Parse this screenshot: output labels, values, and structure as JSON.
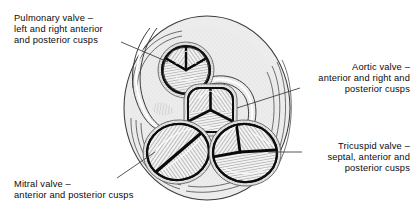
{
  "figure": {
    "type": "anatomical-line-drawing",
    "style": "pen-and-ink engraving with hatching",
    "colors": {
      "background": "#ffffff",
      "ink": "#111111",
      "tissue_fill": "#e9e9e9",
      "cusp_fill": "#f4f4f4",
      "shadow": "#c9c9c9",
      "leader_line": "#444444"
    }
  },
  "labels": {
    "pulmonary": {
      "name": "Pulmonary valve",
      "lines": [
        "Pulmonary valve –",
        "left and right anterior",
        "and posterior cusps"
      ]
    },
    "aortic": {
      "name": "Aortic valve",
      "lines": [
        "Aortic valve –",
        "anterior and right and",
        "posterior cusps"
      ]
    },
    "tricuspid": {
      "name": "Tricuspid valve",
      "lines": [
        "Tricuspid valve –",
        "septal, anterior and",
        "posterior cusps"
      ]
    },
    "mitral": {
      "name": "Mitral valve",
      "lines": [
        "Mitral valve –",
        "anterior and posterior cusps"
      ]
    }
  },
  "valves": [
    {
      "id": "pulmonary",
      "label": "Pulmonary valve",
      "cusp_count": 3,
      "cusps": [
        "left anterior",
        "right anterior",
        "posterior"
      ],
      "shape": "circular",
      "position": "upper-left-of-centre",
      "cx": 186,
      "cy": 70,
      "rx": 26,
      "ry": 25
    },
    {
      "id": "aortic",
      "label": "Aortic valve",
      "cusp_count": 3,
      "cusps": [
        "anterior",
        "right",
        "posterior"
      ],
      "shape": "rounded-square",
      "position": "centre",
      "cx": 210,
      "cy": 110,
      "rx": 25,
      "ry": 24
    },
    {
      "id": "mitral",
      "label": "Mitral valve",
      "cusp_count": 2,
      "cusps": [
        "anterior",
        "posterior"
      ],
      "shape": "oval-with-oblique-commissure",
      "position": "lower-left",
      "cx": 178,
      "cy": 152,
      "rx": 32,
      "ry": 29
    },
    {
      "id": "tricuspid",
      "label": "Tricuspid valve",
      "cusp_count": 3,
      "cusps": [
        "septal",
        "anterior",
        "posterior"
      ],
      "shape": "oval",
      "position": "lower-right",
      "cx": 245,
      "cy": 153,
      "rx": 33,
      "ry": 30
    }
  ],
  "leaders": [
    {
      "from": "pulmonary-label",
      "to": "pulmonary-valve"
    },
    {
      "from": "aortic-label",
      "to": "aortic-valve"
    },
    {
      "from": "tricuspid-label",
      "to": "tricuspid-valve"
    },
    {
      "from": "mitral-label",
      "to": "mitral-valve"
    }
  ]
}
